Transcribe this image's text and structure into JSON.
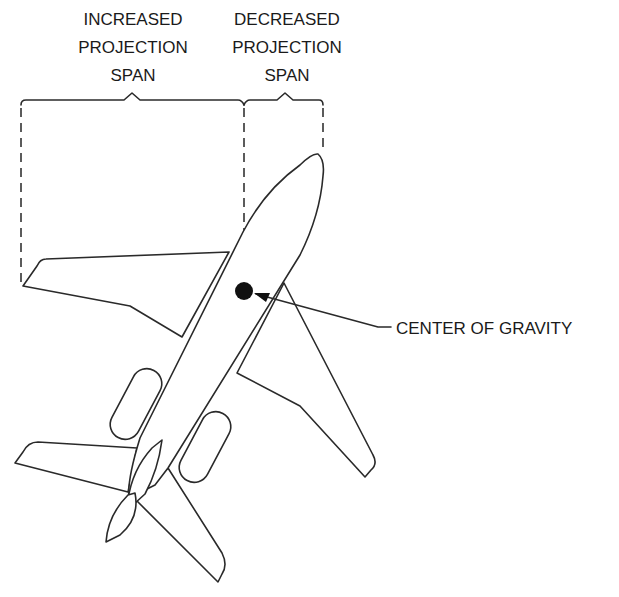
{
  "diagram": {
    "labels": {
      "increased": [
        "INCREASED",
        "PROJECTION",
        "SPAN"
      ],
      "decreased": [
        "DECREASED",
        "PROJECTION",
        "SPAN"
      ],
      "cg": "CENTER OF GRAVITY"
    },
    "colors": {
      "stroke": "#2a2a2a",
      "background": "#ffffff",
      "cg_dot": "#111111"
    }
  }
}
